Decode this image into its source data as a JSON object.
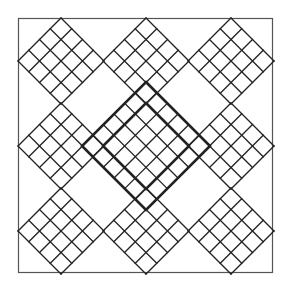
{
  "diagram": {
    "title": "",
    "frame": {
      "x": 18,
      "y": 18,
      "size": 255,
      "color": "#555555"
    },
    "line_color": "#222222",
    "cell": 15,
    "small_diamonds": [
      {
        "cx": 61,
        "cy": 61,
        "half": 43,
        "cells": 4
      },
      {
        "cx": 146,
        "cy": 61,
        "half": 43,
        "cells": 4
      },
      {
        "cx": 231,
        "cy": 61,
        "half": 43,
        "cells": 4
      },
      {
        "cx": 61,
        "cy": 146,
        "half": 43,
        "cells": 4
      },
      {
        "cx": 231,
        "cy": 146,
        "half": 43,
        "cells": 4
      },
      {
        "cx": 61,
        "cy": 231,
        "half": 43,
        "cells": 4
      },
      {
        "cx": 146,
        "cy": 231,
        "half": 43,
        "cells": 4
      },
      {
        "cx": 231,
        "cy": 231,
        "half": 43,
        "cells": 4
      }
    ],
    "center_diamond": {
      "cx": 146,
      "cy": 146,
      "half": 64,
      "cells": 6,
      "thick_inner_half": 43
    }
  }
}
